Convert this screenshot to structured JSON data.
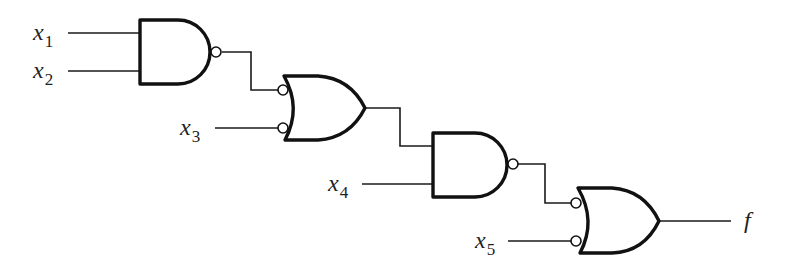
{
  "diagram": {
    "type": "logic-circuit",
    "inputs": [
      {
        "id": "x1",
        "base": "x",
        "sub": "1"
      },
      {
        "id": "x2",
        "base": "x",
        "sub": "2"
      },
      {
        "id": "x3",
        "base": "x",
        "sub": "3"
      },
      {
        "id": "x4",
        "base": "x",
        "sub": "4"
      },
      {
        "id": "x5",
        "base": "x",
        "sub": "5"
      }
    ],
    "output": {
      "id": "f",
      "label": "f"
    },
    "gates": [
      {
        "id": "g1",
        "kind": "NAND",
        "inputs": [
          "x1",
          "x2"
        ],
        "output_inverted": true
      },
      {
        "id": "g2",
        "kind": "OR",
        "inputs": [
          "g1",
          "x3"
        ],
        "inputs_inverted": [
          true,
          true
        ]
      },
      {
        "id": "g3",
        "kind": "NAND",
        "inputs": [
          "g2",
          "x4"
        ],
        "output_inverted": true
      },
      {
        "id": "g4",
        "kind": "OR",
        "inputs": [
          "g3",
          "x5"
        ],
        "inputs_inverted": [
          true,
          true
        ],
        "drives": "f"
      }
    ],
    "colors": {
      "stroke": "#111111",
      "background": "#ffffff"
    }
  }
}
